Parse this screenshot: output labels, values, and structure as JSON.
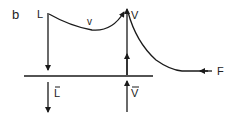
{
  "diagram": {
    "panel_label": "b",
    "nodes": {
      "L": "L",
      "V": "V",
      "F": "F"
    },
    "curve_label": "v",
    "bottom_labels": {
      "L_bar": "L",
      "V_bar": "V"
    },
    "colors": {
      "stroke": "#1a1a1a",
      "background": "#ffffff"
    }
  }
}
